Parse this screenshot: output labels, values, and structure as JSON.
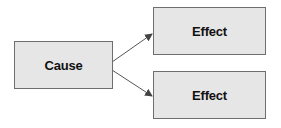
{
  "diagram": {
    "title": "",
    "nodes": [
      {
        "id": "cause",
        "label": "Cause"
      },
      {
        "id": "effect1",
        "label": "Effect"
      },
      {
        "id": "effect2",
        "label": "Effect"
      }
    ],
    "edges": [
      {
        "from": "cause",
        "to": "effect1"
      },
      {
        "from": "cause",
        "to": "effect2"
      }
    ],
    "colors": {
      "box_fill": "#e6e6e6",
      "box_border": "#6e6e6e",
      "arrow": "#444444"
    }
  }
}
